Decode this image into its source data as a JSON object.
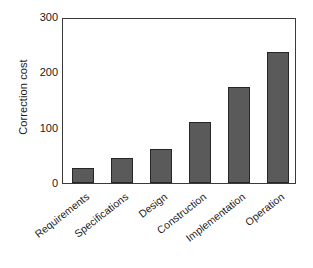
{
  "chart_data": {
    "type": "bar",
    "title": "",
    "xlabel": "",
    "ylabel": "Correction cost",
    "categories": [
      "Requirements",
      "Specifications",
      "Design",
      "Construction",
      "Implementation",
      "Operation"
    ],
    "values": [
      27,
      45,
      61,
      111,
      173,
      236
    ],
    "ylim": [
      0,
      300
    ],
    "yticks": [
      0,
      100,
      200,
      300
    ],
    "ytick_labels": [
      "0",
      "100",
      "200",
      "300"
    ],
    "grid": false,
    "legend": null,
    "bar_color": "#5a5a5a",
    "bar_edge_color": "#262626",
    "axis_color": "#3a3a3a",
    "background_color": "#ffffff",
    "xtick_label_rotation": -38
  }
}
